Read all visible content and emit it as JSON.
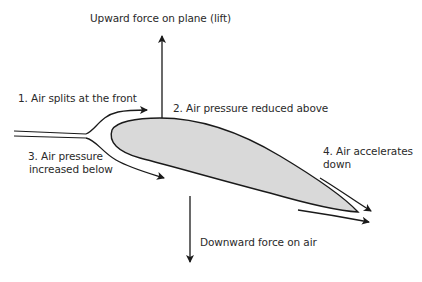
{
  "diagram": {
    "type": "airfoil-lift-explanation",
    "colors": {
      "line": "#1a1a1a",
      "wing_fill": "#d9d9d9",
      "text": "#2a2a2a",
      "background": "#ffffff"
    },
    "labels": {
      "lift": "Upward force on plane (lift)",
      "step1": "1. Air splits at the front",
      "step2": "2. Air pressure reduced above",
      "step3_line1": "3. Air pressure",
      "step3_line2": "increased below",
      "step4_line1": "4. Air accelerates",
      "step4_line2": "down",
      "downward": "Downward force on air"
    },
    "arrows": [
      {
        "name": "lift-arrow",
        "direction": "up"
      },
      {
        "name": "upper-flow-arrow",
        "direction": "right"
      },
      {
        "name": "lower-flow-arrow",
        "direction": "right-down"
      },
      {
        "name": "downward-force-arrow",
        "direction": "down"
      },
      {
        "name": "trailing-upper-arrow",
        "direction": "right-down"
      },
      {
        "name": "trailing-lower-arrow",
        "direction": "right"
      }
    ]
  }
}
